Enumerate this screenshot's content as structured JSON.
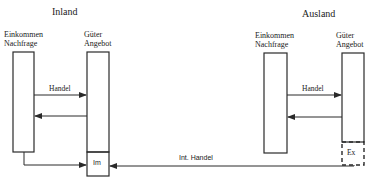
{
  "diagram": {
    "inland": {
      "title": "Inland",
      "demand_label_line1": "Einkommen",
      "demand_label_line2": "Nachfrage",
      "supply_label_line1": "Güter",
      "supply_label_line2": "Angebot",
      "trade_label": "Handel",
      "import_label": "Im"
    },
    "ausland": {
      "title": "Ausland",
      "demand_label_line1": "Einkommen",
      "demand_label_line2": "Nachfrage",
      "supply_label_line1": "Güter",
      "supply_label_line2": "Angebot",
      "trade_label": "Handel",
      "export_label": "Ex"
    },
    "international_trade_label": "Int. Handel",
    "colors": {
      "line": "#2a2a2a",
      "background": "#ffffff"
    }
  }
}
